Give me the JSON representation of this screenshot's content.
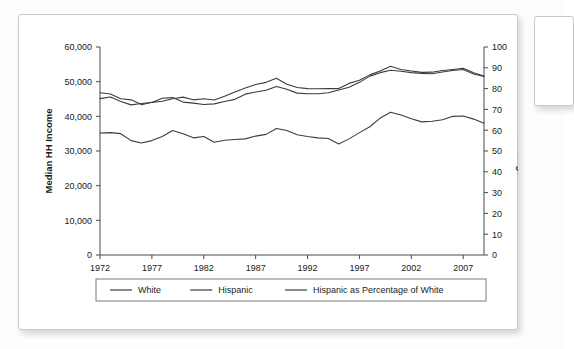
{
  "figure": {
    "card_label": "chart-card"
  },
  "chart_data": {
    "type": "line",
    "title": "",
    "xlabel": "",
    "ylabel": "Median HH Income",
    "y2label": "Percentage",
    "xlim": [
      1972,
      2009
    ],
    "ylim": [
      0,
      60000
    ],
    "y2lim": [
      0,
      100
    ],
    "grid": false,
    "legend_position": "bottom",
    "x_ticks": [
      "1972",
      "1977",
      "1982",
      "1987",
      "1992",
      "1997",
      "2002",
      "2007"
    ],
    "x_tick_values": [
      1972,
      1977,
      1982,
      1987,
      1992,
      1997,
      2002,
      2007
    ],
    "y_ticks": [
      "0",
      "10,000",
      "20,000",
      "30,000",
      "40,000",
      "50,000",
      "60,000"
    ],
    "y_tick_values": [
      0,
      10000,
      20000,
      30000,
      40000,
      50000,
      60000
    ],
    "y2_ticks": [
      "0",
      "10",
      "20",
      "30",
      "40",
      "50",
      "60",
      "70",
      "80",
      "90",
      "100"
    ],
    "y2_tick_values": [
      0,
      10,
      20,
      30,
      40,
      50,
      60,
      70,
      80,
      90,
      100
    ],
    "x": [
      1972,
      1973,
      1974,
      1975,
      1976,
      1977,
      1978,
      1979,
      1980,
      1981,
      1982,
      1983,
      1984,
      1985,
      1986,
      1987,
      1988,
      1989,
      1990,
      1991,
      1992,
      1993,
      1994,
      1995,
      1996,
      1997,
      1998,
      1999,
      2000,
      2001,
      2002,
      2003,
      2004,
      2005,
      2006,
      2007,
      2008,
      2009
    ],
    "series": [
      {
        "name": "White",
        "axis": "left",
        "values": [
          45100,
          45600,
          44300,
          43300,
          43700,
          44000,
          45200,
          45400,
          44100,
          43800,
          43400,
          43600,
          44300,
          44900,
          46400,
          47000,
          47500,
          48600,
          47800,
          46700,
          46500,
          46500,
          46800,
          47600,
          48400,
          49800,
          51600,
          52600,
          53300,
          53000,
          52600,
          52400,
          52300,
          52800,
          53200,
          53500,
          52200,
          51500
        ]
      },
      {
        "name": "Hispanic",
        "axis": "left",
        "values": [
          35200,
          35300,
          35000,
          33000,
          32300,
          33000,
          34200,
          35900,
          35000,
          33800,
          34200,
          32500,
          33100,
          33300,
          33500,
          34300,
          34800,
          36500,
          35900,
          34700,
          34200,
          33800,
          33600,
          32000,
          33500,
          35300,
          37000,
          39500,
          41200,
          40400,
          39300,
          38400,
          38600,
          39000,
          40000,
          40100,
          39200,
          38000
        ]
      },
      {
        "name": "Hispanic as Percentage of White",
        "axis": "right",
        "values": [
          78.0,
          77.4,
          75.1,
          74.6,
          72.3,
          73.4,
          73.9,
          75.1,
          75.9,
          74.6,
          75.1,
          74.5,
          76.3,
          78.4,
          80.3,
          82.0,
          83.0,
          85.0,
          82.1,
          80.5,
          80.0,
          79.9,
          80.0,
          80.0,
          82.5,
          84.0,
          86.6,
          88.5,
          90.7,
          89.2,
          88.5,
          87.8,
          87.9,
          88.7,
          89.2,
          89.8,
          87.6,
          86.1
        ]
      }
    ],
    "legend": [
      {
        "label": "White"
      },
      {
        "label": "Hispanic"
      },
      {
        "label": "Hispanic as Percentage of White"
      }
    ]
  }
}
